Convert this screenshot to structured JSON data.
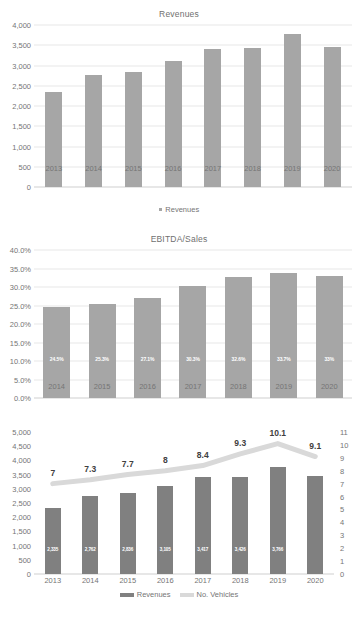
{
  "chart_data": [
    {
      "type": "bar",
      "title": "Revenues",
      "xlabel": "",
      "ylabel": "",
      "categories": [
        "2013",
        "2014",
        "2015",
        "2016",
        "2017",
        "2018",
        "2019",
        "2020"
      ],
      "values": [
        2335,
        2762,
        2836,
        3105,
        3417,
        3426,
        3766,
        3450
      ],
      "ylim": [
        0,
        4000
      ],
      "yticks": [
        "0",
        "500",
        "1,000",
        "1,500",
        "2,000",
        "2,500",
        "3,000",
        "3,500",
        "4,000"
      ],
      "ytick_values": [
        0,
        500,
        1000,
        1500,
        2000,
        2500,
        3000,
        3500,
        4000
      ],
      "grid": true,
      "legend": [
        {
          "label": "Revenues",
          "marker": "square",
          "color": "#a6a6a6"
        }
      ],
      "legend_position": "bottom",
      "series_color": "#a6a6a6"
    },
    {
      "type": "bar",
      "title": "EBITDA/Sales",
      "xlabel": "",
      "ylabel": "",
      "categories": [
        "2014",
        "2015",
        "2016",
        "2017",
        "2018",
        "2019",
        "2020"
      ],
      "values": [
        24.5,
        25.3,
        27.1,
        30.3,
        32.6,
        33.7,
        33.0
      ],
      "data_labels": [
        "24.5%",
        "25.3%",
        "27.1%",
        "30.3%",
        "32.6%",
        "33.7%",
        "33%"
      ],
      "ylim": [
        0,
        40
      ],
      "yticks": [
        "0.0%",
        "5.0%",
        "10.0%",
        "15.0%",
        "20.0%",
        "25.0%",
        "30.0%",
        "35.0%",
        "40.0%"
      ],
      "ytick_values": [
        0,
        5,
        10,
        15,
        20,
        25,
        30,
        35,
        40
      ],
      "grid": true,
      "legend": [],
      "series_color": "#a6a6a6"
    },
    {
      "type": "bar",
      "title": "",
      "xlabel": "",
      "ylabel": "",
      "categories": [
        "2013",
        "2014",
        "2015",
        "2016",
        "2017",
        "2018",
        "2019",
        "2020"
      ],
      "ylim": [
        0,
        5000
      ],
      "yticks": [
        "0",
        "500",
        "1,000",
        "1,500",
        "2,000",
        "2,500",
        "3,000",
        "3,500",
        "4,000",
        "4,500",
        "5,000"
      ],
      "ytick_values": [
        0,
        500,
        1000,
        1500,
        2000,
        2500,
        3000,
        3500,
        4000,
        4500,
        5000
      ],
      "y2lim": [
        0,
        11
      ],
      "y2ticks": [
        "0",
        "1",
        "2",
        "3",
        "4",
        "5",
        "6",
        "7",
        "8",
        "9",
        "10",
        "11"
      ],
      "y2tick_values": [
        0,
        1,
        2,
        3,
        4,
        5,
        6,
        7,
        8,
        9,
        10,
        11
      ],
      "grid": false,
      "legend_position": "bottom",
      "legend": [
        {
          "label": "Revenues",
          "marker": "bar",
          "color": "#808080"
        },
        {
          "label": "No. Vehicles",
          "marker": "line",
          "color": "#d9d9d9"
        }
      ],
      "series": [
        {
          "name": "Revenues",
          "type": "bar",
          "axis": "left",
          "color": "#808080",
          "values": [
            2335,
            2762,
            2836,
            3105,
            3417,
            3426,
            3766,
            3450
          ],
          "data_labels": [
            "2,335",
            "2,762",
            "2,836",
            "3,105",
            "3,417",
            "3,426",
            "3,766",
            ""
          ]
        },
        {
          "name": "No. Vehicles",
          "type": "line",
          "axis": "right",
          "color": "#d9d9d9",
          "values": [
            7,
            7.3,
            7.7,
            8,
            8.4,
            9.3,
            10.1,
            9.1
          ],
          "data_labels": [
            "7",
            "7.3",
            "7.7",
            "8",
            "8.4",
            "9.3",
            "10.1",
            "9.1"
          ]
        }
      ]
    }
  ]
}
